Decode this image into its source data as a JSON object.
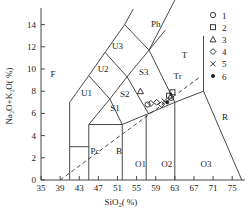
{
  "chart_data": {
    "type": "scatter",
    "title": "",
    "xlabel": "SiO2(%)",
    "ylabel": "Na2O+K2O(%)",
    "xlim": [
      35,
      77
    ],
    "ylim": [
      0,
      15
    ],
    "xticks": [
      "35",
      "39",
      "43",
      "47",
      "51",
      "55",
      "59",
      "63",
      "67",
      "71",
      "75"
    ],
    "yticks": [
      "0",
      "2",
      "4",
      "6",
      "8",
      "10",
      "12",
      "14"
    ],
    "fields": [
      "F",
      "Ph",
      "U3",
      "U2",
      "U1",
      "S3",
      "S2",
      "S1",
      "T",
      "Tr",
      "Pc",
      "B",
      "O1",
      "O2",
      "O3",
      "R"
    ],
    "legend": [
      {
        "symbol": "circle",
        "label": "1"
      },
      {
        "symbol": "square",
        "label": "2"
      },
      {
        "symbol": "triangle",
        "label": "3"
      },
      {
        "symbol": "diamond",
        "label": "4"
      },
      {
        "symbol": "cross",
        "label": "5"
      },
      {
        "symbol": "dot",
        "label": "6"
      }
    ],
    "series": [
      {
        "name": "1",
        "symbol": "circle",
        "points": [
          [
            57.3,
            6.8
          ],
          [
            62.2,
            7.4
          ]
        ]
      },
      {
        "name": "2",
        "symbol": "square",
        "points": [
          [
            61.8,
            7.6
          ],
          [
            62.5,
            7.9
          ]
        ]
      },
      {
        "name": "3",
        "symbol": "triangle",
        "points": [
          [
            55.8,
            8.0
          ]
        ]
      },
      {
        "name": "4",
        "symbol": "diamond",
        "points": [
          [
            58.0,
            6.9
          ],
          [
            59.2,
            7.0
          ],
          [
            60.2,
            6.8
          ]
        ]
      },
      {
        "name": "5",
        "symbol": "cross",
        "points": [
          [
            60.8,
            7.1
          ]
        ]
      },
      {
        "name": "6",
        "symbol": "dot",
        "points": [
          [
            61.4,
            7.0
          ]
        ]
      }
    ],
    "grid": false,
    "legend_position": "top-right"
  },
  "axes": {
    "xlabel_main": "SiO",
    "xlabel_sub": "2",
    "xlabel_tail": "( %)",
    "ylabel": "Na₂O+K₂O( %)"
  }
}
